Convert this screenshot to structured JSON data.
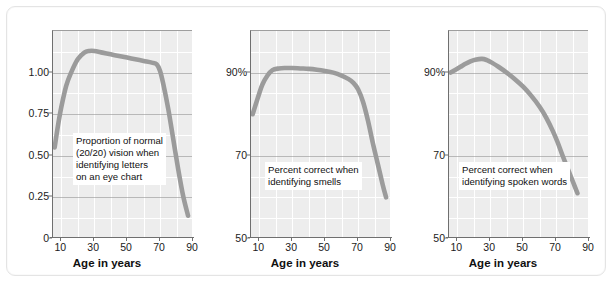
{
  "figure": {
    "panel_count": 3,
    "line_color": "#9b9b9b",
    "plot_bg": "#ededed",
    "grid_color": "#ffffff",
    "axis_color": "#6f6f6f"
  },
  "chart_data": [
    {
      "type": "line",
      "title": "",
      "xlabel": "Age in years",
      "ylabel": "",
      "annotation": "Proportion of normal\n(20/20) vision when\nidentifying letters\non an eye chart",
      "xlim": [
        5,
        90
      ],
      "ylim": [
        0,
        1.25
      ],
      "xticks": [
        10,
        30,
        50,
        70,
        90
      ],
      "xticklabels": [
        "10",
        "30",
        "50",
        "70",
        "90"
      ],
      "xgrid": [
        10,
        20,
        30,
        40,
        50,
        60,
        70,
        80,
        90
      ],
      "yticks": [
        0,
        0.25,
        0.5,
        0.75,
        1.0
      ],
      "yticklabels": [
        "0",
        "0.25",
        "0.50",
        "0.75",
        "1.00"
      ],
      "grid": true,
      "legend": "none",
      "x": [
        6,
        8,
        10,
        13,
        16,
        20,
        24,
        27,
        30,
        35,
        40,
        45,
        50,
        55,
        60,
        65,
        68,
        70,
        72,
        75,
        78,
        81,
        84,
        87
      ],
      "values": [
        0.55,
        0.68,
        0.79,
        0.92,
        1.0,
        1.08,
        1.12,
        1.13,
        1.13,
        1.12,
        1.11,
        1.1,
        1.09,
        1.08,
        1.07,
        1.06,
        1.05,
        1.01,
        0.93,
        0.78,
        0.6,
        0.42,
        0.26,
        0.14
      ]
    },
    {
      "type": "line",
      "title": "",
      "xlabel": "Age in years",
      "ylabel": "",
      "annotation": "Percent correct when\nidentifying smells",
      "xlim": [
        5,
        90
      ],
      "ylim": [
        50,
        100
      ],
      "xticks": [
        10,
        30,
        50,
        70,
        90
      ],
      "xticklabels": [
        "10",
        "30",
        "50",
        "70",
        "90"
      ],
      "xgrid": [
        10,
        20,
        30,
        40,
        50,
        60,
        70,
        80,
        90
      ],
      "yticks": [
        50,
        70,
        90
      ],
      "yticklabels": [
        "50",
        "70",
        "90%"
      ],
      "grid": true,
      "legend": "none",
      "x": [
        6,
        8,
        10,
        12,
        15,
        18,
        22,
        26,
        30,
        35,
        40,
        45,
        50,
        55,
        60,
        64,
        67,
        70,
        73,
        76,
        79,
        82,
        85,
        87
      ],
      "values": [
        80.0,
        82.5,
        85.0,
        87.2,
        89.3,
        90.6,
        91.0,
        91.1,
        91.1,
        91.0,
        90.9,
        90.7,
        90.4,
        90.0,
        89.3,
        88.5,
        87.6,
        86.0,
        83.0,
        78.5,
        73.0,
        68.0,
        63.0,
        60.0
      ]
    },
    {
      "type": "line",
      "title": "",
      "xlabel": "Age in years",
      "ylabel": "",
      "annotation": "Percent correct when\nidentifying spoken words",
      "xlim": [
        5,
        90
      ],
      "ylim": [
        50,
        100
      ],
      "xticks": [
        10,
        30,
        50,
        70,
        90
      ],
      "xticklabels": [
        "10",
        "30",
        "50",
        "70",
        "90"
      ],
      "xgrid": [
        10,
        20,
        30,
        40,
        50,
        60,
        70,
        80,
        90
      ],
      "yticks": [
        50,
        70,
        90
      ],
      "yticklabels": [
        "50",
        "70",
        "90%"
      ],
      "grid": true,
      "legend": "none",
      "x": [
        6,
        9,
        12,
        15,
        18,
        21,
        25,
        28,
        31,
        35,
        40,
        45,
        50,
        55,
        60,
        64,
        68,
        71,
        74,
        77,
        80,
        83
      ],
      "values": [
        90.0,
        90.7,
        91.4,
        92.1,
        92.7,
        93.1,
        93.3,
        93.0,
        92.4,
        91.4,
        90.0,
        88.4,
        86.6,
        84.4,
        81.8,
        79.2,
        76.0,
        73.2,
        70.0,
        67.0,
        64.0,
        61.0
      ]
    }
  ]
}
